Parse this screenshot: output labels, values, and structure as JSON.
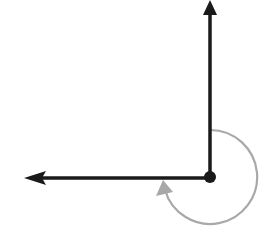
{
  "diagram": {
    "type": "angle",
    "vertex": {
      "x": 210,
      "y": 177
    },
    "rays": [
      {
        "name": "vertical-ray",
        "direction": "up",
        "end": {
          "x": 210,
          "y": 4
        }
      },
      {
        "name": "horizontal-ray",
        "direction": "left",
        "end": {
          "x": 24,
          "y": 178
        }
      }
    ],
    "arc": {
      "center": {
        "x": 210,
        "y": 177
      },
      "radius": 47,
      "sweep_degrees": 270,
      "direction": "clockwise",
      "color": "#a8a8a8"
    },
    "colors": {
      "ray": "#1a1a1a",
      "arc": "#a8a8a8",
      "background": "#ffffff"
    }
  }
}
